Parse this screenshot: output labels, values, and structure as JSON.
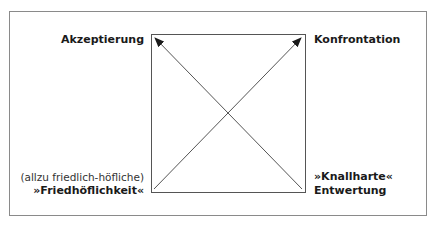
{
  "diagram": {
    "type": "quadrant-arrows",
    "box": {
      "x": 151,
      "y": 34,
      "width": 154,
      "height": 158
    },
    "frame": {
      "x": 9,
      "y": 11,
      "width": 418,
      "height": 205
    },
    "colors": {
      "line": "#555555",
      "frame": "#8a8a8a",
      "text": "#1a1a1a",
      "background": "#ffffff"
    },
    "corners": {
      "top_left": {
        "label": "Akzeptierung"
      },
      "top_right": {
        "label": "Konfrontation"
      },
      "bottom_left": {
        "sublabel": "(allzu friedlich-höfliche)",
        "label": "»Friedhöflichkeit«"
      },
      "bottom_right": {
        "line1": "»Knallharte«",
        "line2": "Entwertung"
      }
    },
    "arrows": [
      {
        "from": "bottom_right",
        "to": "top_left",
        "x1": 302,
        "y1": 189,
        "x2": 155,
        "y2": 38
      },
      {
        "from": "bottom_left",
        "to": "top_right",
        "x1": 154,
        "y1": 189,
        "x2": 301,
        "y2": 38
      }
    ]
  }
}
